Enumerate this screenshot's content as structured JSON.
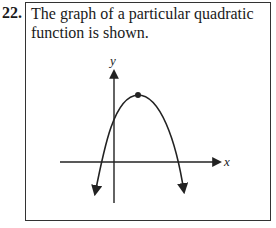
{
  "question": {
    "number": "22.",
    "prompt": "The graph of a particular quadratic function is shown."
  },
  "graph": {
    "x_axis_label": "x",
    "y_axis_label": "y",
    "curve": "downward-opening parabola",
    "vertex_marked": true
  }
}
